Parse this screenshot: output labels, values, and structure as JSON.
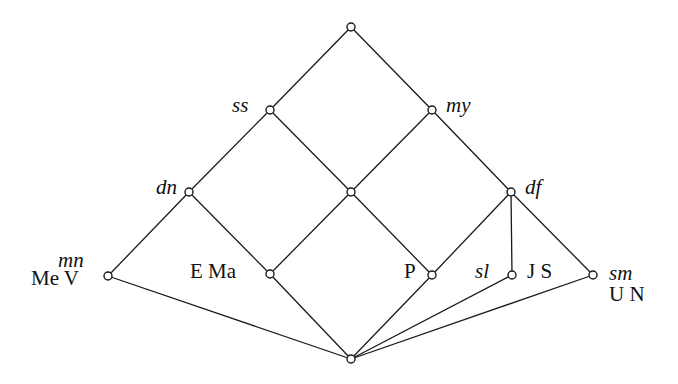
{
  "diagram": {
    "type": "lattice (Hasse diagram)",
    "nodes": [
      {
        "id": "top",
        "x": 351,
        "y": 27,
        "label": ""
      },
      {
        "id": "ss",
        "x": 270,
        "y": 110,
        "label": "ss"
      },
      {
        "id": "my",
        "x": 432,
        "y": 110,
        "label": "my"
      },
      {
        "id": "dn",
        "x": 189,
        "y": 192,
        "label": "dn"
      },
      {
        "id": "center",
        "x": 351,
        "y": 192,
        "label": ""
      },
      {
        "id": "df",
        "x": 511,
        "y": 192,
        "label": "df"
      },
      {
        "id": "mn",
        "x": 108,
        "y": 276,
        "label": "mn",
        "sublabel": "Me V"
      },
      {
        "id": "ema",
        "x": 270,
        "y": 274,
        "label": "E Ma"
      },
      {
        "id": "p",
        "x": 432,
        "y": 275,
        "label": "P"
      },
      {
        "id": "sl",
        "x": 512,
        "y": 275,
        "label": "sl",
        "sublabel": "J S"
      },
      {
        "id": "sm",
        "x": 593,
        "y": 275,
        "label": "sm",
        "sublabel": "U N"
      },
      {
        "id": "bottom",
        "x": 351,
        "y": 359,
        "label": ""
      }
    ],
    "edges": [
      [
        "top",
        "ss"
      ],
      [
        "top",
        "my"
      ],
      [
        "ss",
        "dn"
      ],
      [
        "ss",
        "center"
      ],
      [
        "my",
        "center"
      ],
      [
        "my",
        "df"
      ],
      [
        "dn",
        "mn"
      ],
      [
        "dn",
        "ema"
      ],
      [
        "center",
        "ema"
      ],
      [
        "center",
        "p"
      ],
      [
        "df",
        "p"
      ],
      [
        "df",
        "sl"
      ],
      [
        "df",
        "sm"
      ],
      [
        "mn",
        "bottom"
      ],
      [
        "ema",
        "bottom"
      ],
      [
        "p",
        "bottom"
      ],
      [
        "sl",
        "bottom"
      ],
      [
        "sm",
        "bottom"
      ]
    ]
  },
  "labels": {
    "ss": "ss",
    "my": "my",
    "dn": "dn",
    "df": "df",
    "mn": "mn",
    "mev": "Me V",
    "ema": "E Ma",
    "p": "P",
    "sl": "sl",
    "js": "J S",
    "sm": "sm",
    "un": "U N"
  },
  "colors": {
    "line": "#1a1a1a",
    "node_fill": "#ffffff",
    "background": "#ffffff"
  }
}
